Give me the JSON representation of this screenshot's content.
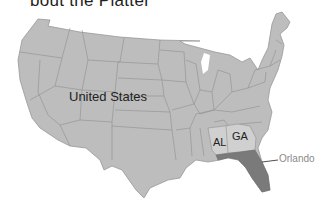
{
  "caption": "bout the Platter",
  "map": {
    "region": "United States",
    "labels": {
      "country": "United States",
      "alabama": "AL",
      "georgia": "GA",
      "city": "Orlando"
    },
    "colors": {
      "land": "#bdbdbd",
      "border": "#8f8f8f",
      "highlight_states": "#d0d0d0",
      "florida": "#7a7a7a",
      "city_label": "#8a8a8a",
      "background": "#ffffff"
    }
  }
}
